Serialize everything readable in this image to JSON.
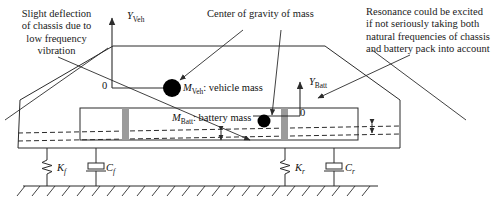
{
  "figure": {
    "type": "engineering-schematic"
  },
  "annotations": {
    "left_note": "Slight deflection\nof chassis due to\nlow frequency\nvibration",
    "center_note": "Center of gravity of mass",
    "right_note": "Resonance could be excited\nif not seriously taking both\nnatural frequencies of chassis\nand battery pack into account"
  },
  "masses": [
    {
      "id": "vehicle-mass",
      "symbol": "M",
      "subscript": "Veh",
      "description": ": vehicle mass",
      "full_label": "MVeh: vehicle mass"
    },
    {
      "id": "battery-mass",
      "symbol": "M",
      "subscript": "Batt",
      "description": ": battery mass",
      "full_label": "MBatt: battery mass"
    }
  ],
  "axes": [
    {
      "id": "vehicle-axis",
      "symbol": "Y",
      "subscript": "Veh",
      "origin_label": "0"
    },
    {
      "id": "battery-axis",
      "symbol": "Y",
      "subscript": "Batt",
      "origin_label": "0"
    }
  ],
  "suspension": [
    {
      "id": "front-spring",
      "symbol": "K",
      "subscript": "f",
      "kind": "spring"
    },
    {
      "id": "front-damper",
      "symbol": "C",
      "subscript": "f",
      "kind": "damper"
    },
    {
      "id": "rear-spring",
      "symbol": "K",
      "subscript": "r",
      "kind": "spring"
    },
    {
      "id": "rear-damper",
      "symbol": "C",
      "subscript": "r",
      "kind": "damper"
    }
  ],
  "colors": {
    "line": "#2b2b2b",
    "mass_marker": "#000000",
    "mount_bar": "#9b9b9b",
    "background": "#ffffff",
    "text": "#111111"
  }
}
